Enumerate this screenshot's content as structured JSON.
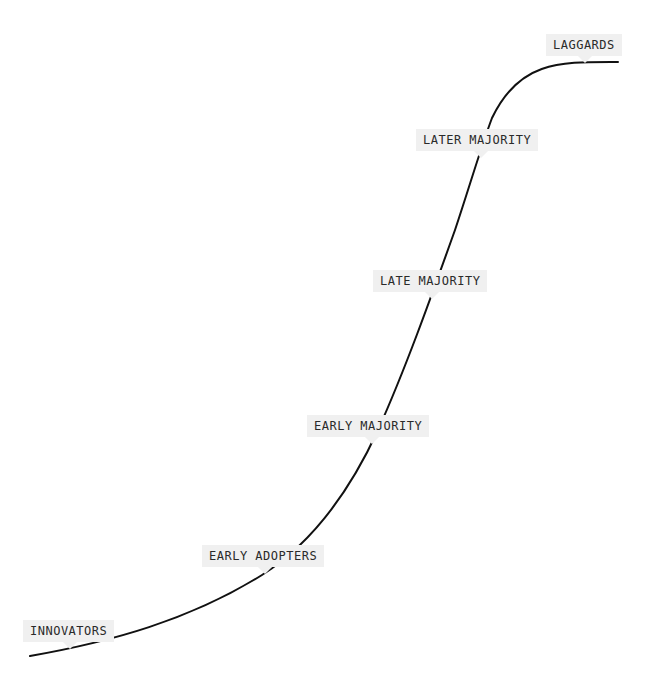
{
  "diagram": {
    "type": "s-curve",
    "stroke_color": "#111111",
    "label_background": "#f0f0f0",
    "label_text_color": "#2a2a2a",
    "stages": [
      {
        "id": "innovators",
        "label": "INNOVATORS"
      },
      {
        "id": "early-adopters",
        "label": "EARLY ADOPTERS"
      },
      {
        "id": "early-majority",
        "label": "EARLY MAJORITY"
      },
      {
        "id": "late-majority",
        "label": "LATE MAJORITY"
      },
      {
        "id": "later-majority",
        "label": "LATER MAJORITY"
      },
      {
        "id": "laggards",
        "label": "LAGGARDS"
      }
    ]
  }
}
